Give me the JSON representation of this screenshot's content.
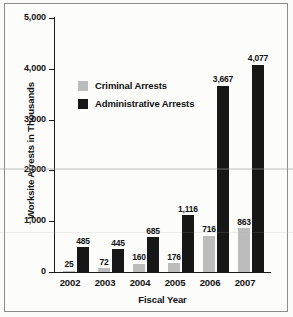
{
  "chart_data": {
    "type": "bar",
    "title": "",
    "xlabel": "Fiscal Year",
    "ylabel": "Worksite Arrests in Thousands",
    "categories": [
      "2002",
      "2003",
      "2004",
      "2005",
      "2006",
      "2007"
    ],
    "series": [
      {
        "name": "Criminal Arrests",
        "color": "#bcbcbc",
        "values": [
          25,
          72,
          160,
          176,
          716,
          863
        ],
        "labels": [
          "25",
          "72",
          "160",
          "176",
          "716",
          "863"
        ]
      },
      {
        "name": "Administrative Arrests",
        "color": "#171717",
        "values": [
          485,
          445,
          685,
          1116,
          3667,
          4077
        ],
        "labels": [
          "485",
          "445",
          "685",
          "1,116",
          "3,667",
          "4,077"
        ]
      }
    ],
    "ylim": [
      0,
      5000
    ],
    "yticks": [
      0,
      1000,
      2000,
      3000,
      4000,
      5000
    ],
    "ytick_labels": [
      "0",
      "1,000",
      "2,000",
      "3,000",
      "4,000",
      "5,000"
    ],
    "grid": false,
    "legend_position": "upper-left-inside"
  },
  "legend": {
    "items": [
      {
        "label": "Criminal Arrests",
        "swatch": "criminal"
      },
      {
        "label": "Administrative Arrests",
        "swatch": "admin"
      }
    ]
  },
  "axes": {
    "y_title": "Worksite Arrests in Thousands",
    "x_title": "Fiscal Year",
    "y_ticks": [
      "5,000",
      "4,000",
      "3,000",
      "2,000",
      "1,000",
      "0"
    ]
  }
}
